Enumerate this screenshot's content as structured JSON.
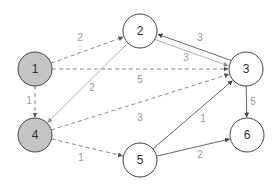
{
  "diagram": {
    "type": "directed-weighted-graph",
    "colors": {
      "background": "#ffffff",
      "node_stroke": "#444444",
      "node_fill_default": "#ffffff",
      "node_fill_highlight": "#c4c4c4",
      "edge_dashed": "#8a8a8a",
      "edge_solid_light": "#b0b0b0",
      "edge_solid_dark": "#6a6a6a",
      "label": "#9a9a9a"
    },
    "nodes": [
      {
        "id": "1",
        "label": "1",
        "x": 35,
        "y": 69,
        "highlighted": true
      },
      {
        "id": "2",
        "label": "2",
        "x": 140,
        "y": 31,
        "highlighted": false
      },
      {
        "id": "3",
        "label": "3",
        "x": 246,
        "y": 69,
        "highlighted": false
      },
      {
        "id": "4",
        "label": "4",
        "x": 35,
        "y": 135,
        "highlighted": true
      },
      {
        "id": "5",
        "label": "5",
        "x": 140,
        "y": 160,
        "highlighted": false
      },
      {
        "id": "6",
        "label": "6",
        "x": 247,
        "y": 135,
        "highlighted": false
      }
    ],
    "edges": [
      {
        "from": "1",
        "to": "2",
        "weight": "2",
        "style": "dashed",
        "label_x": 80,
        "label_y": 37
      },
      {
        "from": "1",
        "to": "3",
        "weight": "5",
        "style": "dashed",
        "label_x": 140,
        "label_y": 79
      },
      {
        "from": "1",
        "to": "4",
        "weight": "1",
        "style": "dashed",
        "label_x": 29,
        "label_y": 100
      },
      {
        "from": "2",
        "to": "4",
        "weight": "2",
        "style": "solid-light",
        "label_x": 92,
        "label_y": 87
      },
      {
        "from": "2",
        "to": "3",
        "weight": "3",
        "style": "solid-light",
        "label_x": 200,
        "label_y": 37
      },
      {
        "from": "3",
        "to": "2",
        "weight": "3",
        "style": "solid-dark",
        "label_x": 186,
        "label_y": 57
      },
      {
        "from": "4",
        "to": "3",
        "weight": "3",
        "style": "dashed",
        "label_x": 140,
        "label_y": 117
      },
      {
        "from": "4",
        "to": "5",
        "weight": "1",
        "style": "dashed",
        "label_x": 81,
        "label_y": 157
      },
      {
        "from": "5",
        "to": "3",
        "weight": "1",
        "style": "solid-dark",
        "label_x": 203,
        "label_y": 118
      },
      {
        "from": "5",
        "to": "6",
        "weight": "2",
        "style": "solid-dark",
        "label_x": 200,
        "label_y": 154
      },
      {
        "from": "3",
        "to": "6",
        "weight": "5",
        "style": "solid-dark",
        "label_x": 253,
        "label_y": 101
      }
    ]
  }
}
